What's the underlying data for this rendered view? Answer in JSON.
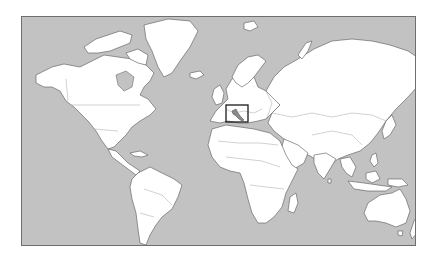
{
  "map": {
    "type": "world-locator-map",
    "projection": "mercator",
    "highlighted_region": "Italy",
    "colors": {
      "ocean": "#c2c2c2",
      "land": "#ffffff",
      "coastline": "#555555",
      "highlight": "#8a8a8a",
      "locator_box": "#1a1a1a"
    },
    "locator_box": {
      "x": 204,
      "y": 88,
      "width": 22,
      "height": 17
    }
  }
}
